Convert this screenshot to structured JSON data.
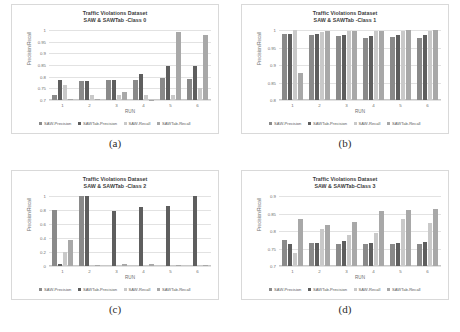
{
  "figure": {
    "legend_labels": [
      "SAW-Precision",
      "SAWTab-Precision",
      "SAW-Recall",
      "SAWTab-Recall"
    ],
    "series_colors": [
      "#8a8a8a",
      "#5e5e5e",
      "#c9c9c9",
      "#a8a8a8"
    ],
    "xlabel": "RUN",
    "ylabel": "Precision/Recall"
  },
  "panels": [
    {
      "caption": "(a)",
      "chart_data": {
        "type": "bar",
        "title": "Traffic Violations Dataset\nSAW & SAWTab -Class 0",
        "title_line1": "Traffic Violations Dataset",
        "title_line2": "SAW & SAWTab -Class 0",
        "xlabel": "RUN",
        "ylabel": "Precision/Recall",
        "categories": [
          "1",
          "2",
          "3",
          "4",
          "5",
          "6"
        ],
        "ticks": [
          "1",
          "0.95",
          "0.9",
          "0.85",
          "0.8",
          "0.75",
          "0.7"
        ],
        "ylim": [
          0.7,
          1.0
        ],
        "grid": true,
        "legend_position": "bottom",
        "series": [
          {
            "name": "SAW-Precision",
            "values": [
              0.722,
              0.783,
              0.785,
              0.787,
              0.793,
              0.792
            ]
          },
          {
            "name": "SAWTab-Precision",
            "values": [
              0.787,
              0.783,
              0.787,
              0.812,
              0.845,
              0.847
            ]
          },
          {
            "name": "SAW-Recall",
            "values": [
              0.763,
              0.722,
              0.722,
              0.723,
              0.722,
              0.753
            ]
          },
          {
            "name": "SAWTab-Recall",
            "values": [
              0.705,
              0.703,
              0.733,
              0.702,
              0.99,
              0.978
            ]
          }
        ]
      }
    },
    {
      "caption": "(b)",
      "chart_data": {
        "type": "bar",
        "title": "Traffic Violations Dataset\nSAW & SAWTab -Class 1",
        "title_line1": "Traffic Violations Dataset",
        "title_line2": "SAW & SAWTab -Class 1",
        "xlabel": "RUN",
        "ylabel": "Precision/Recall",
        "categories": [
          "1",
          "2",
          "3",
          "4",
          "5",
          "6"
        ],
        "ticks": [
          "1",
          "0.95",
          "0.9",
          "0.85",
          "0.8"
        ],
        "ylim": [
          0.8,
          1.0
        ],
        "grid": true,
        "legend_position": "bottom",
        "series": [
          {
            "name": "SAW-Precision",
            "values": [
              0.988,
              0.986,
              0.983,
              0.977,
              0.979,
              0.976
            ]
          },
          {
            "name": "SAWTab-Precision",
            "values": [
              0.99,
              0.988,
              0.985,
              0.983,
              0.987,
              0.985
            ]
          },
          {
            "name": "SAW-Recall",
            "values": [
              0.999,
              0.995,
              0.997,
              0.996,
              0.998,
              0.996
            ]
          },
          {
            "name": "SAWTab-Recall",
            "values": [
              0.876,
              0.997,
              0.998,
              0.997,
              0.999,
              1.0
            ]
          }
        ]
      }
    },
    {
      "caption": "(c)",
      "chart_data": {
        "type": "bar",
        "title": "Traffic Violations Dataset\nSAW & SAWTab -Class 2",
        "title_line1": "Traffic Violations Dataset",
        "title_line2": "SAW & SAWTab -Class 2",
        "xlabel": "RUN",
        "ylabel": "Precision/Recall",
        "categories": [
          "1",
          "2",
          "3",
          "4",
          "5",
          "6"
        ],
        "ticks": [
          "1",
          "0.8",
          "0.6",
          "0.4",
          "0.2",
          "0"
        ],
        "ylim": [
          0.0,
          1.0
        ],
        "grid": true,
        "legend_position": "bottom",
        "series": [
          {
            "name": "SAW-Precision",
            "values": [
              0.8,
              1.0,
              0.0,
              0.0,
              0.0,
              0.0
            ]
          },
          {
            "name": "SAWTab-Precision",
            "values": [
              0.025,
              1.0,
              0.79,
              0.84,
              0.86,
              1.0
            ]
          },
          {
            "name": "SAW-Recall",
            "values": [
              0.205,
              0.0,
              0.0,
              0.0,
              0.0,
              0.0
            ]
          },
          {
            "name": "SAWTab-Recall",
            "values": [
              0.37,
              0.02,
              0.022,
              0.025,
              0.012,
              0.012
            ]
          }
        ]
      }
    },
    {
      "caption": "(d)",
      "chart_data": {
        "type": "bar",
        "title": "Traffic Violations Dataset\nSAW & SAWTab-Class 3",
        "title_line1": "Traffic Violations Dataset",
        "title_line2": "SAW & SAWTab-Class 3",
        "xlabel": "RUN",
        "ylabel": "Precision/Recall",
        "categories": [
          "1",
          "2",
          "3",
          "4",
          "5",
          "6"
        ],
        "ticks": [
          "0.9",
          "0.85",
          "0.8",
          "0.75",
          "0.7"
        ],
        "ylim": [
          0.7,
          0.9
        ],
        "grid": true,
        "legend_position": "bottom",
        "series": [
          {
            "name": "SAW-Precision",
            "values": [
              0.775,
              0.766,
              0.764,
              0.764,
              0.763,
              0.762
            ]
          },
          {
            "name": "SAWTab-Precision",
            "values": [
              0.764,
              0.766,
              0.771,
              0.765,
              0.766,
              0.77
            ]
          },
          {
            "name": "SAW-Recall",
            "values": [
              0.736,
              0.806,
              0.789,
              0.793,
              0.833,
              0.824
            ]
          },
          {
            "name": "SAWTab-Recall",
            "values": [
              0.834,
              0.818,
              0.827,
              0.856,
              0.859,
              0.862
            ]
          }
        ]
      }
    }
  ]
}
